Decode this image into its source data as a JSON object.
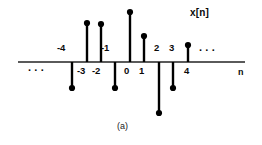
{
  "figure": {
    "caption": "(a)",
    "signal_label": "x[n]",
    "axis_label": "n",
    "left_ellipsis": "· · ·",
    "right_ellipsis": "· · ·",
    "line_color": "#000000",
    "axis_color": "#555555",
    "background_color": "#ffffff"
  },
  "chart_data": {
    "type": "line",
    "plot_style": "stem",
    "title": "",
    "subtitle": "",
    "xlabel": "n",
    "ylabel": "x[n]",
    "grid": false,
    "legend_position": "none",
    "xlim": [
      -5.4,
      5.6
    ],
    "ylim": [
      -2.2,
      2.6
    ],
    "x": [
      -4,
      -3,
      -2,
      -1,
      0,
      1,
      2,
      3,
      4
    ],
    "values": [
      -1.0,
      1.6,
      1.55,
      -1.0,
      2.2,
      1.15,
      -2.0,
      -1.0,
      0.65
    ],
    "tick_labels": [
      "-4",
      "-3",
      "-2",
      "-1",
      "0",
      "1",
      "2",
      "3",
      "4"
    ],
    "tick_label_side": [
      "above",
      "below",
      "below",
      "above",
      "below",
      "below",
      "above",
      "above",
      "below"
    ],
    "annotations": [
      "· · ·",
      "x[n]",
      "· · ·",
      "n",
      "(a)"
    ]
  },
  "stems": [
    {
      "n": "-4",
      "label": "-4",
      "side": "above",
      "x": 72,
      "tip_y": 88,
      "dir": "down"
    },
    {
      "n": "-3",
      "label": "-3",
      "side": "below",
      "x": 87,
      "tip_y": 23,
      "dir": "up"
    },
    {
      "n": "-2",
      "label": "-2",
      "side": "below",
      "x": 101,
      "tip_y": 24,
      "dir": "up"
    },
    {
      "n": "-1",
      "label": "-1",
      "side": "above",
      "x": 115,
      "tip_y": 88,
      "dir": "down"
    },
    {
      "n": "0",
      "label": "0",
      "side": "below",
      "x": 130,
      "tip_y": 12,
      "dir": "up"
    },
    {
      "n": "1",
      "label": "1",
      "side": "below",
      "x": 144,
      "tip_y": 36,
      "dir": "up"
    },
    {
      "n": "2",
      "label": "2",
      "side": "above",
      "x": 159,
      "tip_y": 113,
      "dir": "down"
    },
    {
      "n": "3",
      "label": "3",
      "side": "above",
      "x": 173,
      "tip_y": 88,
      "dir": "down"
    },
    {
      "n": "4",
      "label": "4",
      "side": "below",
      "x": 188,
      "tip_y": 45,
      "dir": "up"
    }
  ],
  "tick_text": {
    "t0": "-4",
    "t1": "-3",
    "t2": "-2",
    "t3": "-1",
    "t4": "0",
    "t5": "1",
    "t6": "2",
    "t7": "3",
    "t8": "4"
  }
}
